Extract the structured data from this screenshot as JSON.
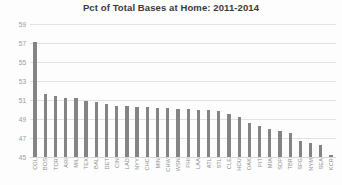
{
  "chart_data": {
    "type": "bar",
    "title": "Pct of Total Bases at Home: 2011-2014",
    "xlabel": "",
    "ylabel": "",
    "ylim": [
      45,
      59
    ],
    "yticks": [
      59,
      57,
      55,
      53,
      51,
      49,
      47,
      45
    ],
    "grid": true,
    "legend": null,
    "bar_color": "#848484",
    "categories": [
      "COL",
      "BOS",
      "TOR",
      "ARI",
      "MIL",
      "TEX",
      "BAL",
      "DET",
      "CIN",
      "LAD",
      "NYY",
      "CHC",
      "MIN",
      "CHW",
      "WSN",
      "PHI",
      "LAA",
      "ATL",
      "STL",
      "CLE",
      "HOU",
      "OAK",
      "PIT",
      "MIA",
      "SDP",
      "TBR",
      "SFG",
      "NYM",
      "SEA",
      "KCR"
    ],
    "values": [
      57.1,
      51.6,
      51.4,
      51.2,
      51.2,
      50.9,
      50.8,
      50.6,
      50.4,
      50.4,
      50.3,
      50.3,
      50.2,
      50.2,
      50.1,
      50.1,
      50.0,
      50.0,
      49.8,
      49.5,
      49.2,
      48.6,
      48.3,
      47.9,
      47.7,
      47.5,
      46.7,
      46.5,
      46.3,
      45.2
    ]
  }
}
